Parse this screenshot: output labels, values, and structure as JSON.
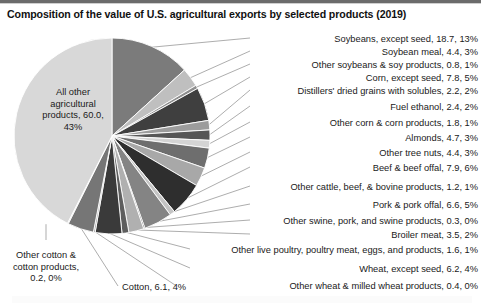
{
  "chart_title": "Composition of the value of U.S. agricultural exports by selected products (2019)",
  "chart_data": {
    "type": "pie",
    "title": "Composition of the value of U.S. agricultural exports by selected products (2019)",
    "value_unit": "billion USD",
    "start_angle_deg": 0,
    "direction": "clockwise",
    "legend": "none",
    "grid": false,
    "categories": [
      "Soybeans, except seed",
      "Soybean meal",
      "Other soybeans & soy products",
      "Corn, except seed",
      "Distillers' dried grains with solubles",
      "Fuel ethanol",
      "Other corn & corn products",
      "Almonds",
      "Other tree nuts",
      "Beef & beef offal",
      "Other cattle, beef, & bovine products",
      "Pork & pork offal",
      "Other swine, pork, and swine products",
      "Broiler meat",
      "Other live poultry, poultry meat, eggs, and products",
      "Wheat, except seed",
      "Other wheat & milled wheat products",
      "Cotton",
      "Other cotton & cotton products",
      "All other agricultural products"
    ],
    "values": [
      18.7,
      4.4,
      0.8,
      7.8,
      2.2,
      2.4,
      1.8,
      4.7,
      4.4,
      7.9,
      1.2,
      6.6,
      0.3,
      3.5,
      1.6,
      6.2,
      0.4,
      6.1,
      0.2,
      60.0
    ],
    "percents": [
      13,
      3,
      1,
      5,
      2,
      2,
      1,
      3,
      3,
      6,
      1,
      5,
      0,
      2,
      1,
      4,
      0,
      4,
      0,
      43
    ],
    "colors": [
      "#7b7b7b",
      "#bfbfbf",
      "#8e8e8e",
      "#3f3f3f",
      "#9c9c9c",
      "#565656",
      "#d4d4d4",
      "#6e6e6e",
      "#a8a8a8",
      "#2e2e2e",
      "#c4c4c4",
      "#848484",
      "#4a4a4a",
      "#b0b0b0",
      "#5e5e5e",
      "#3a3a3a",
      "#9a9a9a",
      "#767676",
      "#bdbdbd",
      "#d8d8d8"
    ]
  },
  "slice_labels": [
    {
      "name": "soybeans-except-seed",
      "text": "Soybeans, except seed, 18.7, 13%",
      "x": 478,
      "y": 34,
      "align": "right"
    },
    {
      "name": "soybean-meal",
      "text": "Soybean meal, 4.4, 3%",
      "x": 478,
      "y": 47,
      "align": "right"
    },
    {
      "name": "other-soybeans-soy-products",
      "text": "Other soybeans & soy products, 0.8, 1%",
      "x": 478,
      "y": 60,
      "align": "right"
    },
    {
      "name": "corn-except-seed",
      "text": "Corn, except seed, 7.8, 5%",
      "x": 478,
      "y": 73,
      "align": "right"
    },
    {
      "name": "distillers-dried-grains",
      "text": "Distillers' dried grains with solubles, 2.2, 2%",
      "x": 478,
      "y": 86,
      "align": "right"
    },
    {
      "name": "fuel-ethanol",
      "text": "Fuel ethanol, 2.4, 2%",
      "x": 478,
      "y": 102,
      "align": "right"
    },
    {
      "name": "other-corn-corn-products",
      "text": "Other corn & corn products, 1.8, 1%",
      "x": 478,
      "y": 118,
      "align": "right"
    },
    {
      "name": "almonds",
      "text": "Almonds, 4.7, 3%",
      "x": 478,
      "y": 133,
      "align": "right"
    },
    {
      "name": "other-tree-nuts",
      "text": "Other tree nuts, 4.4, 3%",
      "x": 478,
      "y": 148,
      "align": "right"
    },
    {
      "name": "beef-beef-offal",
      "text": "Beef & beef offal, 7.9, 6%",
      "x": 478,
      "y": 163,
      "align": "right"
    },
    {
      "name": "other-cattle-beef-bovine",
      "text": "Other cattle, beef, & bovine products, 1.2, 1%",
      "x": 478,
      "y": 182,
      "align": "right"
    },
    {
      "name": "pork-pork-offal",
      "text": "Pork & pork offal, 6.6, 5%",
      "x": 478,
      "y": 200,
      "align": "right"
    },
    {
      "name": "other-swine-pork",
      "text": "Other swine, pork, and swine products, 0.3, 0%",
      "x": 478,
      "y": 216,
      "align": "right"
    },
    {
      "name": "broiler-meat",
      "text": "Broiler meat, 3.5, 2%",
      "x": 478,
      "y": 230,
      "align": "right"
    },
    {
      "name": "other-live-poultry",
      "text": "Other live poultry, poultry meat, eggs, and products, 1.6, 1%",
      "x": 478,
      "y": 245,
      "align": "right"
    },
    {
      "name": "wheat-except-seed",
      "text": "Wheat, except seed, 6.2, 4%",
      "x": 478,
      "y": 264,
      "align": "right"
    },
    {
      "name": "other-wheat-milled",
      "text": "Other wheat & milled wheat products, 0.4, 0%",
      "x": 478,
      "y": 281,
      "align": "right"
    },
    {
      "name": "cotton",
      "text": "Cotton, 6.1, 4%",
      "x": 122,
      "y": 282,
      "align": "left"
    }
  ],
  "boxed_labels": [
    {
      "name": "other-cotton-cotton-products",
      "lines": [
        "Other cotton &",
        "cotton products,",
        "0.2, 0%"
      ],
      "x": 4,
      "y": 250,
      "width": 84
    }
  ],
  "inner_labels": [
    {
      "name": "all-other-agricultural-products",
      "lines": [
        "All other",
        "agricultural",
        "products, 60.0,",
        "43%"
      ],
      "x": 25,
      "y": 87,
      "width": 96
    }
  ],
  "geometry": {
    "center_x": 112,
    "center_y": 136,
    "radius": 98
  }
}
